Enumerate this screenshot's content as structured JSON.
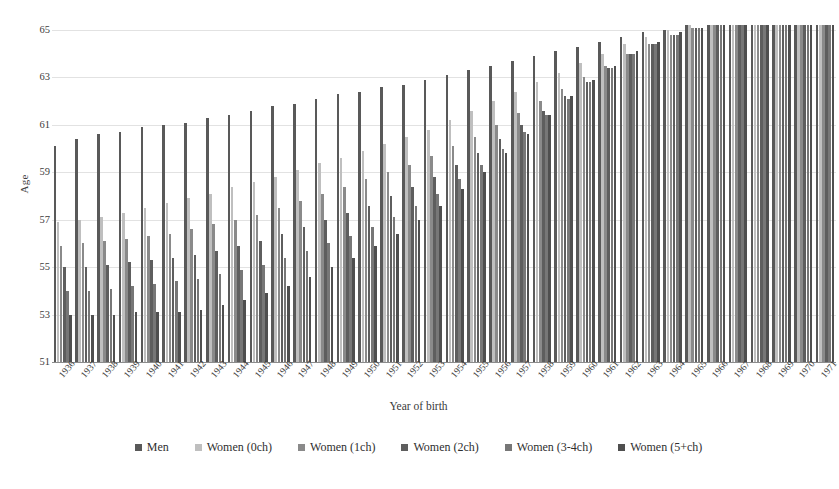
{
  "chart_data": {
    "type": "bar",
    "title": "",
    "xlabel": "Year of birth",
    "ylabel": "Age",
    "ylim": [
      51,
      65
    ],
    "yticks": [
      51,
      53,
      55,
      57,
      59,
      61,
      63,
      65
    ],
    "grid": true,
    "legend_position": "bottom",
    "categories": [
      "1936",
      "1937",
      "1938",
      "1939",
      "1940",
      "1941",
      "1942",
      "1943",
      "1944",
      "1945",
      "1946",
      "1947",
      "1948",
      "1949",
      "1950",
      "1951",
      "1952",
      "1953",
      "1954",
      "1955",
      "1956",
      "1957",
      "1958",
      "1959",
      "1960",
      "1961",
      "1962",
      "1963",
      "1964",
      "1965",
      "1966",
      "1967",
      "1968",
      "1969",
      "1970",
      "1971"
    ],
    "series": [
      {
        "name": "Men",
        "color": "#595959",
        "values": [
          60.1,
          60.4,
          60.6,
          60.7,
          60.9,
          61.0,
          61.1,
          61.3,
          61.4,
          61.6,
          61.8,
          61.9,
          62.1,
          62.3,
          62.4,
          62.6,
          62.7,
          62.9,
          63.1,
          63.3,
          63.5,
          63.7,
          63.9,
          64.1,
          64.3,
          64.5,
          64.7,
          64.9,
          65.0,
          65.2,
          65.2,
          65.2,
          65.2,
          65.2,
          65.2,
          65.2
        ]
      },
      {
        "name": "Women (0ch)",
        "color": "#bfbfbf",
        "values": [
          56.9,
          57.0,
          57.1,
          57.3,
          57.5,
          57.7,
          57.9,
          58.1,
          58.4,
          58.6,
          58.8,
          59.1,
          59.4,
          59.6,
          59.9,
          60.2,
          60.5,
          60.8,
          61.2,
          61.6,
          62.0,
          62.4,
          62.8,
          63.2,
          63.6,
          64.0,
          64.4,
          64.7,
          65.0,
          65.2,
          65.2,
          65.2,
          65.2,
          65.2,
          65.2,
          65.2
        ]
      },
      {
        "name": "Women (1ch)",
        "color": "#8a8a8a",
        "values": [
          55.9,
          56.0,
          56.1,
          56.2,
          56.3,
          56.4,
          56.6,
          56.8,
          57.0,
          57.2,
          57.5,
          57.8,
          58.1,
          58.4,
          58.7,
          59.0,
          59.3,
          59.7,
          60.1,
          60.5,
          61.0,
          61.5,
          62.0,
          62.5,
          63.0,
          63.5,
          64.0,
          64.4,
          64.8,
          65.1,
          65.2,
          65.2,
          65.2,
          65.2,
          65.2,
          65.2
        ]
      },
      {
        "name": "Women (2ch)",
        "color": "#5e5e5e",
        "values": [
          55.0,
          55.0,
          55.1,
          55.2,
          55.3,
          55.4,
          55.5,
          55.7,
          55.9,
          56.1,
          56.4,
          56.7,
          57.0,
          57.3,
          57.6,
          58.0,
          58.4,
          58.8,
          59.3,
          59.8,
          60.4,
          61.0,
          61.6,
          62.2,
          62.8,
          63.4,
          64.0,
          64.4,
          64.8,
          65.1,
          65.2,
          65.2,
          65.2,
          65.2,
          65.2,
          65.2
        ]
      },
      {
        "name": "Women (3-4ch)",
        "color": "#777777",
        "values": [
          54.0,
          54.0,
          54.1,
          54.2,
          54.3,
          54.4,
          54.5,
          54.7,
          54.9,
          55.1,
          55.4,
          55.7,
          56.0,
          56.3,
          56.7,
          57.1,
          57.6,
          58.1,
          58.7,
          59.3,
          60.0,
          60.7,
          61.4,
          62.1,
          62.8,
          63.4,
          64.0,
          64.4,
          64.8,
          65.1,
          65.2,
          65.2,
          65.2,
          65.2,
          65.2,
          65.2
        ]
      },
      {
        "name": "Women (5+ch)",
        "color": "#4f4f4f",
        "values": [
          53.0,
          53.0,
          53.0,
          53.1,
          53.1,
          53.1,
          53.2,
          53.4,
          53.6,
          53.9,
          54.2,
          54.6,
          55.0,
          55.4,
          55.9,
          56.4,
          57.0,
          57.6,
          58.3,
          59.0,
          59.8,
          60.6,
          61.4,
          62.2,
          62.9,
          63.5,
          64.1,
          64.5,
          64.9,
          65.1,
          65.2,
          65.2,
          65.2,
          65.2,
          65.2,
          65.2
        ]
      }
    ]
  }
}
